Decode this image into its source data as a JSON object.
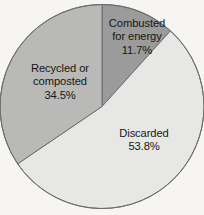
{
  "figure": {
    "name": "municipal-waste-disposition-pie-chart",
    "background_color": "#f6f5f2"
  },
  "chart_data": {
    "type": "pie",
    "title": "",
    "subtitle": "",
    "xlabel": "",
    "ylabel": "",
    "legend_position": "none",
    "grid": false,
    "labels_inside": true,
    "start_angle_deg": 0,
    "direction": "clockwise",
    "categories": [
      "Combusted for energy",
      "Discarded",
      "Recycled or composted"
    ],
    "values": [
      11.7,
      53.8,
      34.5
    ],
    "value_unit": "%",
    "slices": [
      {
        "name": "Combusted for energy",
        "label_line_1": "Combusted",
        "label_line_2": "for energy",
        "value": 11.7,
        "value_text": "11.7%",
        "color": "#9b9b9b",
        "start_angle_deg": 0,
        "end_angle_deg": 42.12
      },
      {
        "name": "Discarded",
        "label_line_1": "Discarded",
        "label_line_2": "",
        "value": 53.8,
        "value_text": "53.8%",
        "color": "#e7e7e5",
        "start_angle_deg": 42.12,
        "end_angle_deg": 235.8
      },
      {
        "name": "Recycled or composted",
        "label_line_1": "Recycled or",
        "label_line_2": "composted",
        "value": 34.5,
        "value_text": "34.5%",
        "color": "#b9b9b7",
        "start_angle_deg": 235.8,
        "end_angle_deg": 360
      }
    ],
    "outline_color": "#6d6d6d",
    "label_text_color": "#171717"
  }
}
